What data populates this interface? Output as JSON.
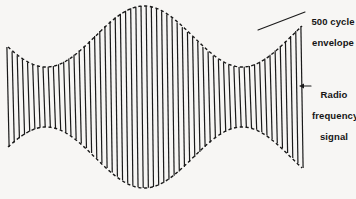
{
  "figure": {
    "background_color": "#f7f6f4",
    "ink_color": "#1a1a1a"
  },
  "annotations": {
    "envelope": {
      "text": "500 cycle\nenvelope",
      "line1": "500 cycle",
      "line2": "envelope",
      "leader": "plain-line",
      "leader_from": [
        305,
        12
      ],
      "leader_to": [
        258,
        30
      ]
    },
    "rf": {
      "text": "Radio\nfrequency\nsignal",
      "line1": "Radio",
      "line2": "frequency",
      "line3": "signal",
      "leader": "left-arrow",
      "leader_from": [
        311,
        86
      ],
      "leader_to": [
        299,
        86
      ]
    }
  },
  "chart_data": {
    "type": "line",
    "xlabel": "",
    "ylabel": "",
    "grid": false,
    "legend": "none",
    "x_start": 8,
    "x_end": 302,
    "baseline_y": 97,
    "xlim": [
      0,
      356
    ],
    "ylim": [
      199,
      0
    ],
    "series": [
      {
        "name": "500 cycle envelope",
        "style": "dashed",
        "kind": "envelope",
        "peak_amplitude": 91,
        "min_amplitude": 30,
        "modulation_cycles": 1.5,
        "phase_offset_deg": 110,
        "peaks_x": [
          45,
          222
        ],
        "waist_x": [
          133
        ],
        "top_y_at_peak": 6,
        "bottom_y_at_peak": 188,
        "top_y_at_waist": 67,
        "bottom_y_at_waist": 127
      },
      {
        "name": "Radio frequency signal",
        "style": "solid",
        "kind": "carrier-lines",
        "line_count": 58,
        "line_spacing_px": 5.1,
        "line_width_px": 1.2,
        "carrier_tilt_px": 2.2
      }
    ]
  }
}
